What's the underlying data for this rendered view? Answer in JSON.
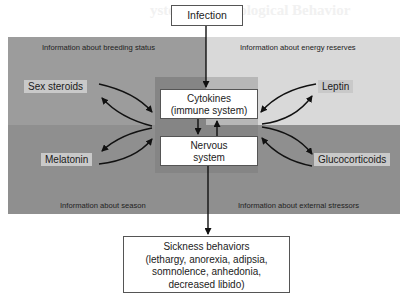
{
  "watermark": "ystems and Biological Behavior",
  "top_input": {
    "label": "Infection"
  },
  "quadrants": {
    "top_left": "Information about breeding status",
    "top_right": "Information about energy reserves",
    "bottom_left": "Information about season",
    "bottom_right": "Information about external stressors"
  },
  "center": {
    "immune": {
      "line1": "Cytokines",
      "line2": "(immune system)"
    },
    "nervous": {
      "line1": "Nervous",
      "line2": "system"
    }
  },
  "hormones": {
    "top_left": "Sex steroids",
    "bottom_left": "Melatonin",
    "top_right": "Leptin",
    "bottom_right": "Glucocorticoids"
  },
  "output": {
    "line1": "Sickness behaviors",
    "line2": "(lethargy, anorexia, adipsia,",
    "line3": "somnolence, anhedonia,",
    "line4": "decreased libido)"
  },
  "colors": {
    "top_left_bg": "#9c9c9c",
    "top_right_bg": "#d9d9d9",
    "bottom_bg": "#8f8f8f",
    "hormone_label_bg": "#c9c9c9",
    "arrow": "#111111"
  }
}
